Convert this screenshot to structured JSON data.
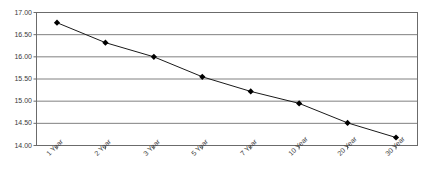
{
  "chart_data": {
    "type": "line",
    "title": "",
    "subtitle": "",
    "xlabel": "",
    "ylabel": "",
    "categories": [
      "1 Year",
      "2 Year",
      "3 Year",
      "5 Year",
      "7 Year",
      "10 Year",
      "20 Year",
      "30 Year"
    ],
    "values": [
      16.77,
      16.32,
      16.0,
      15.55,
      15.22,
      14.95,
      14.51,
      14.18
    ],
    "series": [
      {
        "name": "",
        "values": [
          16.77,
          16.32,
          16.0,
          15.55,
          15.22,
          14.95,
          14.51,
          14.18
        ]
      }
    ],
    "ylim": [
      14.0,
      17.0
    ],
    "ytick_labels": [
      "17.00",
      "16.50",
      "16.00",
      "15.50",
      "15.00",
      "14.50",
      "14.00"
    ],
    "ytick_values": [
      17.0,
      16.5,
      16.0,
      15.5,
      15.0,
      14.5,
      14.0
    ],
    "grid": "horizontal",
    "legend": "none",
    "marker": "diamond",
    "line_color": "#1a1a1a",
    "marker_color": "#000000",
    "grid_color": "#808080",
    "axis_color": "#6b6b6b",
    "plot_background": "#ffffff"
  }
}
